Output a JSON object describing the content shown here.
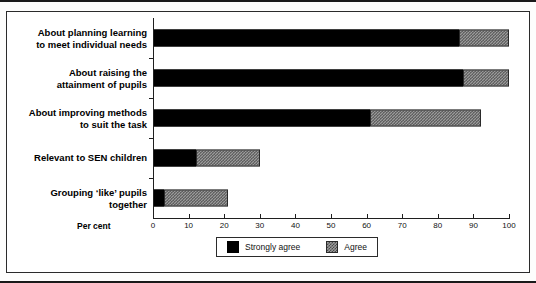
{
  "chart_data": {
    "type": "bar",
    "orientation": "horizontal",
    "stacked": true,
    "title": "",
    "xlabel": "Per cent",
    "ylabel": "",
    "xlim": [
      0,
      100
    ],
    "xticks": [
      0,
      10,
      20,
      30,
      40,
      50,
      60,
      70,
      80,
      90,
      100
    ],
    "grid": false,
    "legend_position": "bottom-right",
    "categories": [
      "About planning learning to meet individual needs",
      "About raising the attainment of pupils",
      "About improving methods to suit the task",
      "Relevant to SEN children",
      "Grouping ‘like’ pupils together"
    ],
    "category_lines": [
      [
        "About planning learning",
        "to meet individual needs"
      ],
      [
        "About raising the",
        "attainment of pupils"
      ],
      [
        "About improving methods",
        "to suit the task"
      ],
      [
        "Relevant to SEN children"
      ],
      [
        "Grouping ‘like’ pupils",
        "together"
      ]
    ],
    "series": [
      {
        "name": "Strongly agree",
        "color": "#000000",
        "values": [
          86,
          87,
          61,
          12,
          3
        ]
      },
      {
        "name": "Agree",
        "color": "#9a9a9a",
        "values": [
          14,
          13,
          31,
          18,
          18
        ]
      }
    ],
    "totals": [
      100,
      100,
      92,
      30,
      21
    ]
  },
  "legend": {
    "entries": [
      {
        "label": "Strongly agree"
      },
      {
        "label": "Agree"
      }
    ]
  },
  "axis": {
    "percent_label": "Per cent"
  }
}
